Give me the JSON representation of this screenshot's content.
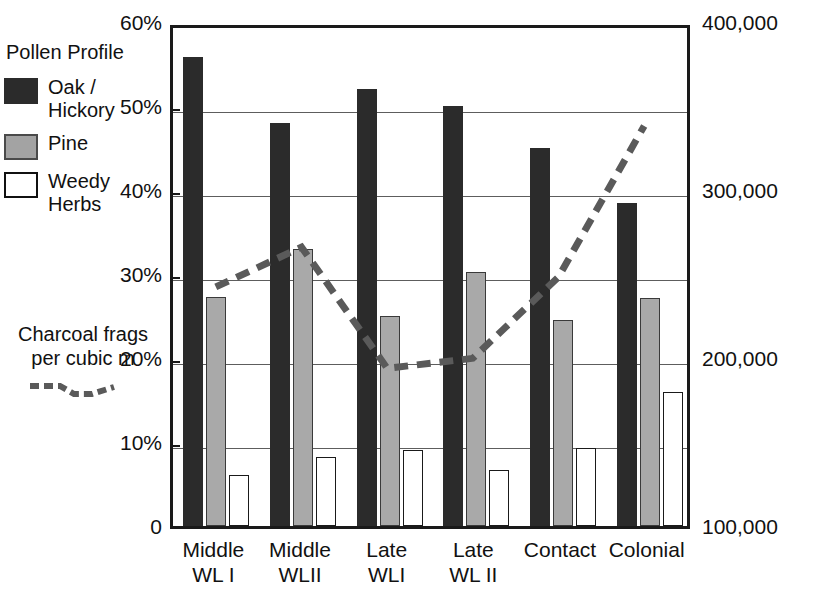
{
  "legend": {
    "title": "Pollen Profile",
    "items": [
      {
        "label": "Oak / Hickory",
        "swatch": "dark",
        "color": "#2b2b2b"
      },
      {
        "label": "Pine",
        "swatch": "gray",
        "color": "#a9a9a9"
      },
      {
        "label": "Weedy Herbs",
        "swatch": "white",
        "color": "#ffffff"
      }
    ],
    "charcoal_label": "Charcoal frags per cubic m",
    "charcoal_color": "#5a5a5a"
  },
  "chart_data": {
    "type": "bar",
    "title": "",
    "xlabel": "",
    "ylabel": "",
    "categories": [
      "Middle WL I",
      "Middle WLII",
      "Late WLI",
      "Late WL II",
      "Contact",
      "Colonial"
    ],
    "category_lines": [
      [
        "Middle",
        "WL I"
      ],
      [
        "Middle",
        "WLII"
      ],
      [
        "Late",
        "WLI"
      ],
      [
        "Late",
        "WL II"
      ],
      [
        "Contact",
        ""
      ],
      [
        "Colonial",
        ""
      ]
    ],
    "series": [
      {
        "name": "Oak / Hickory",
        "axis": "left",
        "type": "bar",
        "color": "#2b2b2b",
        "values": [
          55.8,
          48.0,
          52.0,
          50.0,
          45.0,
          38.5
        ]
      },
      {
        "name": "Pine",
        "axis": "left",
        "type": "bar",
        "color": "#a9a9a9",
        "values": [
          27.3,
          33.0,
          25.0,
          30.2,
          24.5,
          27.1
        ]
      },
      {
        "name": "Weedy Herbs",
        "axis": "left",
        "type": "bar",
        "color": "#ffffff",
        "values": [
          6.1,
          8.2,
          9.0,
          6.7,
          9.3,
          16.0
        ]
      },
      {
        "name": "Charcoal frags per cubic m",
        "axis": "right",
        "type": "line",
        "color": "#5a5a5a",
        "values": [
          244000,
          268000,
          195000,
          201000,
          250000,
          341000
        ]
      }
    ],
    "left_axis": {
      "ticks": [
        "0",
        "10%",
        "20%",
        "30%",
        "40%",
        "50%",
        "60%"
      ],
      "values": [
        0,
        10,
        20,
        30,
        40,
        50,
        60
      ],
      "min": 0,
      "max": 60
    },
    "right_axis": {
      "ticks": [
        "100,000",
        "200,000",
        "300,000",
        "400,000"
      ],
      "values": [
        100000,
        200000,
        300000,
        400000
      ],
      "min": 100000,
      "max": 400000
    },
    "grid": true,
    "legend_position": "left"
  }
}
